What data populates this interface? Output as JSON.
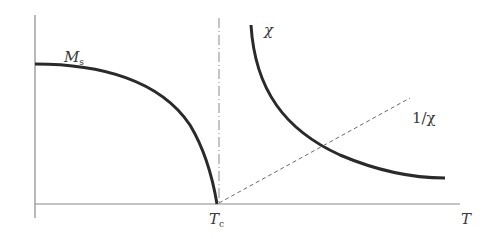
{
  "diagram": {
    "title": "",
    "axes": {
      "x_label": "T",
      "y_label": ""
    },
    "markers": {
      "critical_temperature": {
        "symbol": "T",
        "subscript": "c"
      }
    },
    "curves": [
      {
        "name": "spontaneous-magnetization",
        "label": "M",
        "label_subscript": "s",
        "style": "solid"
      },
      {
        "name": "susceptibility",
        "label": "χ",
        "style": "solid"
      },
      {
        "name": "inverse-susceptibility",
        "label": "1/χ",
        "style": "dashed"
      }
    ],
    "colors": {
      "curve": "#2a2a2a",
      "axis": "#8a8a8a",
      "dashed": "#6a6a6a",
      "text": "#3a3a3a"
    }
  }
}
